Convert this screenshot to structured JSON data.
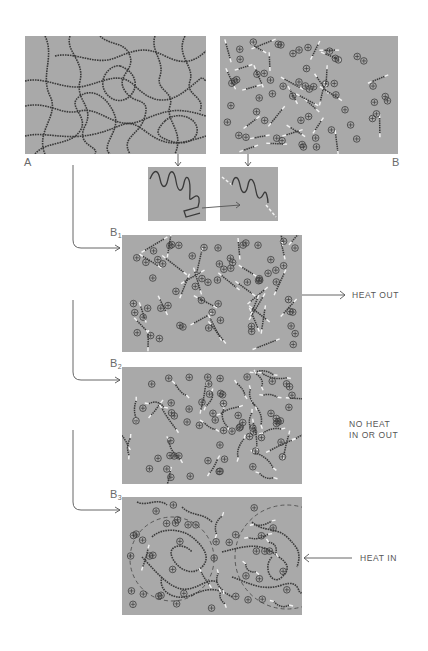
{
  "figure": {
    "panels": {
      "A": {
        "label": "A"
      },
      "B": {
        "label": "B"
      },
      "B1": {
        "label": "B",
        "subscript": "1",
        "annotation": "HEAT OUT"
      },
      "B2": {
        "label": "B",
        "subscript": "2",
        "annotation": "NO HEAT\nIN OR OUT"
      },
      "B3": {
        "label": "B",
        "subscript": "3",
        "annotation": "HEAT IN"
      }
    },
    "colors": {
      "panel_bg": "#a9a9a9",
      "chain": "#3a3a3a",
      "ion_ring": "#3c3c3c",
      "arrow": "#555555",
      "highlight": "#f2f2f2"
    }
  }
}
